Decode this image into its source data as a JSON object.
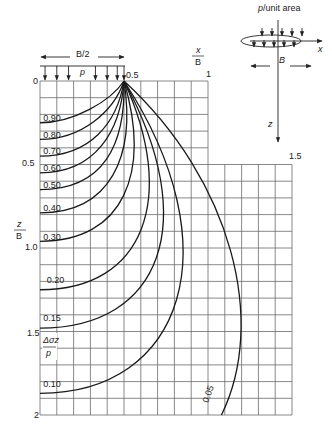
{
  "diagram": {
    "colors": {
      "ink": "#1a1a1a",
      "grid": "#6a6a6a",
      "background": "#ffffff"
    },
    "geometry": {
      "x0": 40,
      "z0": 81,
      "px_per_x": 168,
      "px_per_z": 167
    },
    "loading": {
      "label": "p",
      "width_label": "B/2",
      "arrow_x": [
        0.03,
        0.1,
        0.17,
        0.33,
        0.4,
        0.46,
        0.5
      ]
    },
    "x_axis": {
      "label_top": "x",
      "label_bottom": "B",
      "ticks": [
        {
          "value": 0,
          "label": "0"
        },
        {
          "value": 0.5,
          "label": "0.5"
        },
        {
          "value": 1,
          "label": "1"
        },
        {
          "value": 1.5,
          "label": "1.5"
        }
      ]
    },
    "z_axis": {
      "label_top": "z",
      "label_bottom": "B",
      "ticks": [
        {
          "value": 0.5,
          "label": "0.5"
        },
        {
          "value": 1.0,
          "label": "1.0"
        },
        {
          "value": 1.5,
          "label": "1.5"
        },
        {
          "value": 2,
          "label": "2"
        }
      ]
    },
    "stress_label": {
      "top": "Δσz",
      "bottom": "p"
    },
    "isobars": [
      {
        "label": "0.90",
        "pts": [
          [
            0.5,
            0
          ],
          [
            0.42,
            0.12
          ],
          [
            0.2,
            0.25
          ],
          [
            0,
            0.25
          ]
        ],
        "lx": 0.02,
        "lz": 0.24
      },
      {
        "label": "0.80",
        "pts": [
          [
            0.5,
            0
          ],
          [
            0.44,
            0.18
          ],
          [
            0.25,
            0.35
          ],
          [
            0,
            0.35
          ]
        ],
        "lx": 0.02,
        "lz": 0.34
      },
      {
        "label": "0.70",
        "pts": [
          [
            0.5,
            0
          ],
          [
            0.46,
            0.25
          ],
          [
            0.3,
            0.45
          ],
          [
            0,
            0.45
          ]
        ],
        "lx": 0.02,
        "lz": 0.44
      },
      {
        "label": "0.60",
        "pts": [
          [
            0.5,
            0
          ],
          [
            0.48,
            0.3
          ],
          [
            0.33,
            0.55
          ],
          [
            0,
            0.55
          ]
        ],
        "lx": 0.02,
        "lz": 0.54
      },
      {
        "label": "0.50",
        "pts": [
          [
            0.5,
            0
          ],
          [
            0.51,
            0.38
          ],
          [
            0.38,
            0.65
          ],
          [
            0,
            0.65
          ]
        ],
        "lx": 0.02,
        "lz": 0.64
      },
      {
        "label": "0.40",
        "pts": [
          [
            0.5,
            0
          ],
          [
            0.57,
            0.45
          ],
          [
            0.42,
            0.79
          ],
          [
            0,
            0.79
          ]
        ],
        "lx": 0.02,
        "lz": 0.78
      },
      {
        "label": "0.30",
        "pts": [
          [
            0.5,
            0
          ],
          [
            0.66,
            0.55
          ],
          [
            0.5,
            0.96
          ],
          [
            0,
            0.96
          ]
        ],
        "lx": 0.02,
        "lz": 0.95
      },
      {
        "label": "0.20",
        "pts": [
          [
            0.5,
            0
          ],
          [
            0.82,
            0.7
          ],
          [
            0.62,
            1.25
          ],
          [
            0,
            1.25
          ]
        ],
        "lx": 0.04,
        "lz": 1.21
      },
      {
        "label": "0.15",
        "pts": [
          [
            0.5,
            0
          ],
          [
            0.96,
            0.85
          ],
          [
            0.72,
            1.48
          ],
          [
            0,
            1.48
          ]
        ],
        "lx": 0.02,
        "lz": 1.44
      },
      {
        "label": "0.10",
        "pts": [
          [
            0.5,
            0
          ],
          [
            1.15,
            1.0
          ],
          [
            0.85,
            1.87
          ],
          [
            0,
            1.87
          ]
        ],
        "lx": 0.02,
        "lz": 1.83
      },
      {
        "label": "0.05",
        "pts": [
          [
            0.5,
            0
          ],
          [
            1.15,
            0.6
          ],
          [
            1.35,
            1.45
          ],
          [
            1.08,
            2.0
          ]
        ],
        "lx": 1.0,
        "lz": 1.93,
        "rotate": -70
      }
    ],
    "inset": {
      "load_label": "p/unit area",
      "x_label": "x",
      "width_label": "B",
      "z_label": "z"
    }
  }
}
